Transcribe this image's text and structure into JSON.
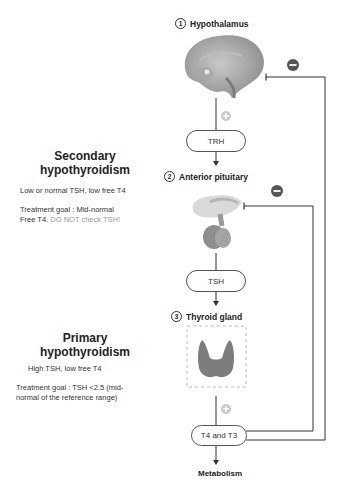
{
  "diagram": {
    "steps": [
      {
        "number": "1",
        "label": "Hypothalamus"
      },
      {
        "number": "2",
        "label": "Anterior pituitary"
      },
      {
        "number": "3",
        "label": "Thyroid gland"
      }
    ],
    "hormones": {
      "trh": "TRH",
      "tsh": "TSH",
      "t4t3": "T4 and T3"
    },
    "output": "Metabolism",
    "signs": {
      "stimulate": "+",
      "inhibit": "−"
    },
    "colors": {
      "line": "#333333",
      "plus_sign": "#c8c8c8",
      "minus_sign": "#555555",
      "muted_text": "#9a9a9a"
    }
  },
  "secondary": {
    "title_line1": "Secondary",
    "title_line2": "hypothyroidism",
    "labs": "Low or normal TSH, low free T4",
    "goal_label": "Treatment goal",
    "goal_text_1": " : Mid-normal",
    "goal_text_2": "Free T4.",
    "goal_warning": " DO NOT check TSH!"
  },
  "primary": {
    "title_line1": "Primary",
    "title_line2": "hypothyroidism",
    "labs": "High TSH, low free T4",
    "goal_label": "Treatment goal",
    "goal_text_1": " : TSH <2.5 (mid-",
    "goal_text_2": "normal of the reference range)"
  }
}
